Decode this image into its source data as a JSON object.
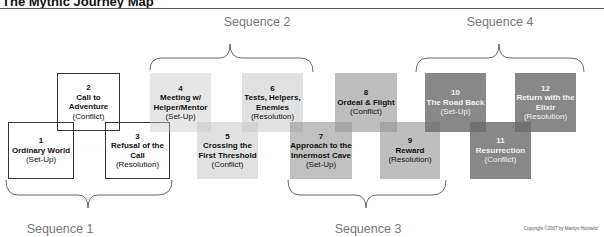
{
  "title": "The Mythic Journey Map",
  "sequences": [
    {
      "label": "Sequence 1",
      "x": 60,
      "y": 222
    },
    {
      "label": "Sequence 2",
      "x": 257,
      "y": 15
    },
    {
      "label": "Sequence 3",
      "x": 368,
      "y": 222
    },
    {
      "label": "Sequence 4",
      "x": 500,
      "y": 15
    }
  ],
  "stages": [
    {
      "num": "1",
      "name": "Ordinary World",
      "act": "(Set-Up)",
      "x": 8,
      "y": 122,
      "w": 66,
      "h": 57,
      "bg": "transparent",
      "fg": "#111111",
      "outlined": true
    },
    {
      "num": "2",
      "name": "Call to Adventure",
      "act": "(Conflict)",
      "x": 57,
      "y": 73,
      "w": 63,
      "h": 58,
      "bg": "transparent",
      "fg": "#111111",
      "outlined": true
    },
    {
      "num": "3",
      "name": "Refusal of the Call",
      "act": "(Resolution)",
      "x": 105,
      "y": 122,
      "w": 65,
      "h": 57,
      "bg": "transparent",
      "fg": "#111111",
      "outlined": true
    },
    {
      "num": "4",
      "name": "Meeting w/ Helper/Mentor",
      "act": "(Set-Up)",
      "x": 150,
      "y": 73,
      "w": 61,
      "h": 59,
      "bg": "rgba(200,200,200,0.45)",
      "fg": "#111111",
      "outlined": false
    },
    {
      "num": "5",
      "name": "Crossing the First Threshold",
      "act": "(Conflict)",
      "x": 197,
      "y": 122,
      "w": 61,
      "h": 57,
      "bg": "rgba(200,200,200,0.55)",
      "fg": "#111111",
      "outlined": false
    },
    {
      "num": "6",
      "name": "Tests, Helpers, Enemies",
      "act": "(Resolution)",
      "x": 242,
      "y": 73,
      "w": 61,
      "h": 59,
      "bg": "rgba(200,200,200,0.55)",
      "fg": "#111111",
      "outlined": false
    },
    {
      "num": "7",
      "name": "Approach to the Innermost Cave",
      "act": "(Set-Up)",
      "x": 290,
      "y": 122,
      "w": 62,
      "h": 57,
      "bg": "rgba(150,150,150,0.6)",
      "fg": "#111111",
      "outlined": false
    },
    {
      "num": "8",
      "name": "Ordeal & Flight",
      "act": "(Conflict)",
      "x": 335,
      "y": 73,
      "w": 62,
      "h": 59,
      "bg": "rgba(150,150,150,0.62)",
      "fg": "#111111",
      "outlined": false
    },
    {
      "num": "9",
      "name": "Reward",
      "act": "(Resolution)",
      "x": 380,
      "y": 122,
      "w": 60,
      "h": 57,
      "bg": "rgba(150,150,150,0.62)",
      "fg": "#111111",
      "outlined": false
    },
    {
      "num": "10",
      "name": "The Road Back",
      "act": "(Set-Up)",
      "x": 425,
      "y": 73,
      "w": 61,
      "h": 59,
      "bg": "rgba(110,110,110,0.82)",
      "fg": "#f2f2f2",
      "outlined": false
    },
    {
      "num": "11",
      "name": "Resurrection",
      "act": "(Conflict)",
      "x": 470,
      "y": 122,
      "w": 61,
      "h": 57,
      "bg": "rgba(110,110,110,0.82)",
      "fg": "#f2f2f2",
      "outlined": false
    },
    {
      "num": "12",
      "name": "Return with the Elixir",
      "act": "(Resolution)",
      "x": 515,
      "y": 73,
      "w": 61,
      "h": 59,
      "bg": "rgba(110,110,110,0.82)",
      "fg": "#f2f2f2",
      "outlined": false
    }
  ],
  "copyright": "Copyright ©2007 by Marilyn Horowitz"
}
